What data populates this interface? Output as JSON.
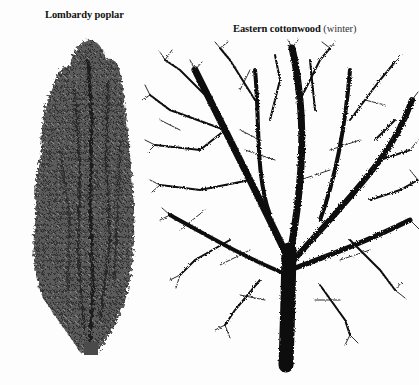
{
  "illustration": {
    "trees": [
      {
        "name": "Lombardy poplar",
        "note": "",
        "style": "columnar, dense foliage",
        "foliage_color": "#5a5a5a"
      },
      {
        "name": "Eastern cottonwood",
        "note": "(winter)",
        "style": "broad crown, bare branches",
        "branch_color": "#0a0a0a"
      }
    ],
    "background_color": "#fdfdfd"
  }
}
